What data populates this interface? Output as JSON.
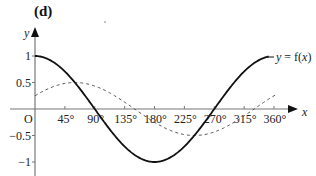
{
  "panel_label": "(d)",
  "chart_data": {
    "type": "line",
    "title": "(d)",
    "xlabel": "x",
    "ylabel": "y",
    "xlim": [
      0,
      360
    ],
    "ylim": [
      -1,
      1
    ],
    "x_ticks": [
      45,
      90,
      135,
      180,
      225,
      270,
      315,
      360
    ],
    "x_tick_labels": [
      "45°",
      "90°",
      "135°",
      "180°",
      "225°",
      "270°",
      "315°",
      "360°"
    ],
    "origin_label": "O",
    "y_ticks": [
      1,
      0.5,
      -0.5,
      -1
    ],
    "y_tick_labels": [
      "1",
      "0.5",
      "−0.5",
      "−1"
    ],
    "grid": false,
    "series": [
      {
        "name": "y = f(x)",
        "style": "solid",
        "color": "#111111",
        "formula": "cos(x)",
        "x": [
          0,
          45,
          90,
          135,
          180,
          225,
          270,
          315,
          360
        ],
        "values": [
          1,
          0.71,
          0,
          -0.71,
          -1,
          -0.71,
          0,
          0.71,
          1
        ]
      },
      {
        "name": "dashed curve",
        "style": "dashed",
        "color": "#555555",
        "formula": "0.5·sin(x + 30°)",
        "x": [
          0,
          45,
          90,
          135,
          180,
          225,
          270,
          315,
          360
        ],
        "values": [
          0.25,
          0.48,
          0.43,
          0.13,
          -0.25,
          -0.48,
          -0.43,
          -0.13,
          0.25
        ]
      }
    ],
    "annotations": [
      {
        "text": "y = f(x)",
        "attached_to": "solid curve",
        "position": "right end"
      }
    ]
  }
}
